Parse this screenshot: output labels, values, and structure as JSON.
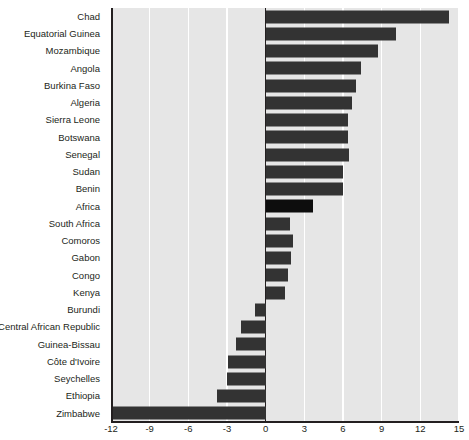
{
  "chart_data": {
    "type": "bar",
    "orientation": "horizontal",
    "title": "",
    "xlabel": "",
    "ylabel": "",
    "xlim": [
      -12,
      15
    ],
    "xticks": [
      -12,
      -9,
      -6,
      -3,
      0,
      3,
      6,
      9,
      12,
      15
    ],
    "xtick_labels": [
      "-12",
      "-9",
      "-6",
      "-3",
      "0",
      "3",
      "6",
      "9",
      "12",
      "15"
    ],
    "grid": true,
    "grid_axis": "x",
    "legend": "none",
    "bar_color": "#333333",
    "highlight_color": "#0d0d0d",
    "plot_background": "#e6e6e6",
    "gridline_color": "#ffffff",
    "highlight_category": "Africa",
    "categories": [
      "Chad",
      "Equatorial Guinea",
      "Mozambique",
      "Angola",
      "Burkina Faso",
      "Algeria",
      "Sierra Leone",
      "Botswana",
      "Senegal",
      "Sudan",
      "Benin",
      "Africa",
      "South Africa",
      "Comoros",
      "Gabon",
      "Congo",
      "Kenya",
      "Burundi",
      "Central African Republic",
      "Guinea-Bissau",
      "Côte d'Ivoire",
      "Seychelles",
      "Ethiopia",
      "Zimbabwe"
    ],
    "values": [
      14.2,
      10.1,
      8.7,
      7.4,
      7.0,
      6.7,
      6.4,
      6.4,
      6.5,
      6.0,
      6.0,
      3.7,
      1.9,
      2.1,
      2.0,
      1.7,
      1.5,
      -0.8,
      -1.9,
      -2.3,
      -2.9,
      -3.0,
      -3.8,
      -11.9
    ]
  },
  "partial_title": ""
}
